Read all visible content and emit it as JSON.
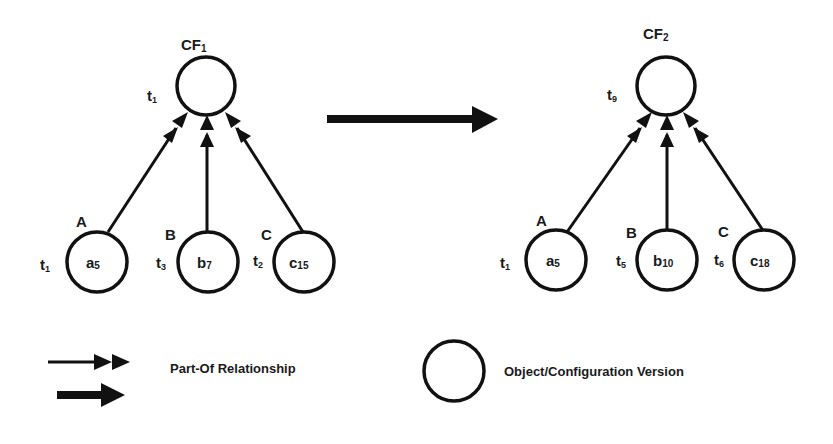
{
  "diagram": {
    "colors": {
      "stroke": "#111111",
      "text": "#1a1a1a",
      "background": "#ffffff"
    },
    "left": {
      "config": {
        "label": "CF",
        "sub": "1",
        "time": "t",
        "time_sub": "1"
      },
      "objects": [
        {
          "name": "A",
          "version": "a",
          "version_sub": "5",
          "time": "t",
          "time_sub": "1"
        },
        {
          "name": "B",
          "version": "b",
          "version_sub": "7",
          "time": "t",
          "time_sub": "3"
        },
        {
          "name": "C",
          "version": "c",
          "version_sub": "15",
          "time": "t",
          "time_sub": "2"
        }
      ]
    },
    "transition_arrow": "evolves-to",
    "right": {
      "config": {
        "label": "CF",
        "sub": "2",
        "time": "t",
        "time_sub": "9"
      },
      "objects": [
        {
          "name": "A",
          "version": "a",
          "version_sub": "5",
          "time": "t",
          "time_sub": "1"
        },
        {
          "name": "B",
          "version": "b",
          "version_sub": "10",
          "time": "t",
          "time_sub": "5"
        },
        {
          "name": "C",
          "version": "c",
          "version_sub": "18",
          "time": "t",
          "time_sub": "6"
        }
      ]
    }
  },
  "legend": {
    "part_of": "Part-Of Relationship",
    "version": "Object/Configuration Version"
  }
}
